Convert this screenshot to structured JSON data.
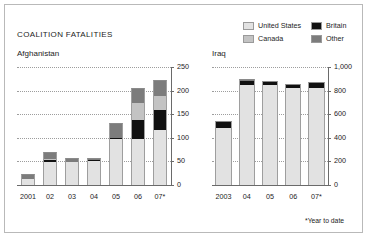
{
  "header": {
    "title": "COALITION FATALITIES",
    "footnote": "*Year to date"
  },
  "legend": {
    "items": [
      {
        "label": "United States",
        "color": "#e2e2e2",
        "name": "united-states"
      },
      {
        "label": "Britain",
        "color": "#111111",
        "name": "britain"
      },
      {
        "label": "Canada",
        "color": "#c3c3c3",
        "name": "canada"
      },
      {
        "label": "Other",
        "color": "#7c7c7c",
        "name": "other"
      }
    ]
  },
  "chart_data": [
    {
      "type": "bar",
      "name": "afghanistan",
      "title": "Afghanistan",
      "stacked": true,
      "categories": [
        "2001",
        "02",
        "03",
        "04",
        "05",
        "06",
        "07*"
      ],
      "xlabel": "",
      "ylabel": "",
      "ylim": [
        0,
        250
      ],
      "yticks": [
        0,
        50,
        100,
        150,
        200,
        250
      ],
      "ytick_labels": [
        "0",
        "50",
        "100",
        "150",
        "200",
        "250"
      ],
      "grid": true,
      "legend_position": "top-right",
      "series": [
        {
          "name": "United States",
          "color": "#e2e2e2",
          "values": [
            12,
            49,
            48,
            52,
            99,
            98,
            117
          ]
        },
        {
          "name": "Britain",
          "color": "#111111",
          "values": [
            0,
            3,
            0,
            1,
            1,
            39,
            41
          ]
        },
        {
          "name": "Canada",
          "color": "#c3c3c3",
          "values": [
            0,
            4,
            0,
            0,
            0,
            36,
            30
          ]
        },
        {
          "name": "Other",
          "color": "#7c7c7c",
          "values": [
            12,
            14,
            10,
            5,
            31,
            32,
            34
          ]
        }
      ]
    },
    {
      "type": "bar",
      "name": "iraq",
      "title": "Iraq",
      "stacked": true,
      "categories": [
        "2003",
        "04",
        "05",
        "06",
        "07*"
      ],
      "xlabel": "",
      "ylabel": "",
      "ylim": [
        0,
        1000
      ],
      "yticks": [
        0,
        200,
        400,
        600,
        800,
        1000
      ],
      "ytick_labels": [
        "0",
        "200",
        "400",
        "600",
        "800",
        "1,000"
      ],
      "grid": true,
      "legend_position": "top-right",
      "series": [
        {
          "name": "United States",
          "color": "#e2e2e2",
          "values": [
            486,
            849,
            846,
            822,
            818
          ]
        },
        {
          "name": "Britain",
          "color": "#111111",
          "values": [
            53,
            30,
            23,
            29,
            44
          ]
        },
        {
          "name": "Canada",
          "color": "#c3c3c3",
          "values": [
            0,
            0,
            0,
            0,
            0
          ]
        },
        {
          "name": "Other",
          "color": "#7c7c7c",
          "values": [
            0,
            23,
            7,
            5,
            8
          ]
        }
      ]
    }
  ]
}
